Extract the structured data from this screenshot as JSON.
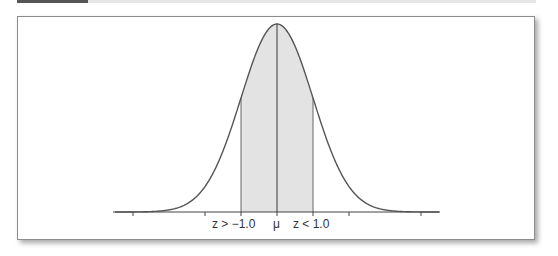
{
  "chart_data": {
    "type": "area",
    "title": "",
    "xlabel": "",
    "ylabel": "",
    "x_range": [
      -4.5,
      4.5
    ],
    "grid": false,
    "legend": null,
    "ticks": [
      -4,
      -2,
      -1,
      0,
      1,
      2,
      4
    ],
    "tick_labels": [
      {
        "x": -1.0,
        "label": "z > −1.0"
      },
      {
        "x": 0,
        "label": "μ"
      },
      {
        "x": 1.0,
        "label": "z < 1.0"
      }
    ],
    "shaded_region": {
      "from": -1.0,
      "to": 1.0,
      "color": "#e3e3e3"
    },
    "curve_color": "#555555",
    "mean_line": true
  },
  "labels": {
    "left": "z > −1.0",
    "mu": "μ",
    "right": "z < 1.0"
  }
}
